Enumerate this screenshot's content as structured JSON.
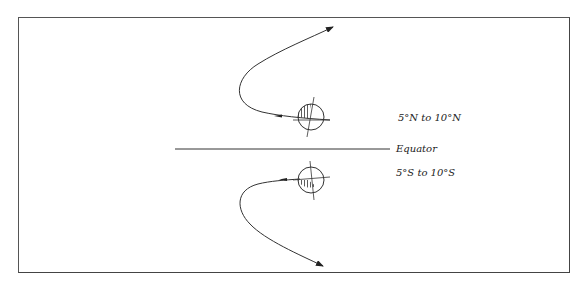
{
  "diagram": {
    "labels": {
      "north": "5°N to 10°N",
      "equator": "Equator",
      "south": "5°S to 10°S"
    },
    "colors": {
      "line": "#333333",
      "border": "#555555",
      "background": "#ffffff"
    },
    "elements": [
      {
        "type": "storm-track",
        "hemisphere": "north",
        "direction": "recurving-northeast"
      },
      {
        "type": "storm-track",
        "hemisphere": "south",
        "direction": "recurving-southeast"
      },
      {
        "type": "cyclone-symbol",
        "hemisphere": "north",
        "shaded_quadrant": "upper-left"
      },
      {
        "type": "cyclone-symbol",
        "hemisphere": "south",
        "shaded_quadrant": "lower-left"
      },
      {
        "type": "equator-line"
      }
    ]
  }
}
